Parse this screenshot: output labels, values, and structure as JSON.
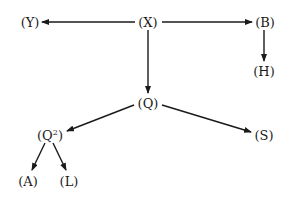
{
  "diagram": {
    "type": "tree",
    "nodes": [
      {
        "id": "X",
        "label": "(X)",
        "text": "X"
      },
      {
        "id": "Y",
        "label": "(Y)",
        "text": "Y"
      },
      {
        "id": "B",
        "label": "(B)",
        "text": "B"
      },
      {
        "id": "H",
        "label": "(H)",
        "text": "H"
      },
      {
        "id": "Q",
        "label": "(Q)",
        "text": "Q"
      },
      {
        "id": "Q2",
        "label": "(Q²)",
        "text": "Q",
        "superscript": "2"
      },
      {
        "id": "S",
        "label": "(S)",
        "text": "S"
      },
      {
        "id": "A",
        "label": "(A)",
        "text": "A"
      },
      {
        "id": "L",
        "label": "(L)",
        "text": "L"
      }
    ],
    "edges": [
      {
        "from": "X",
        "to": "Y"
      },
      {
        "from": "X",
        "to": "B"
      },
      {
        "from": "B",
        "to": "H"
      },
      {
        "from": "X",
        "to": "Q"
      },
      {
        "from": "Q",
        "to": "Q2"
      },
      {
        "from": "Q",
        "to": "S"
      },
      {
        "from": "Q2",
        "to": "A"
      },
      {
        "from": "Q2",
        "to": "L"
      }
    ],
    "colors": {
      "ink": "#1a1a1a",
      "background": "#ffffff"
    }
  }
}
